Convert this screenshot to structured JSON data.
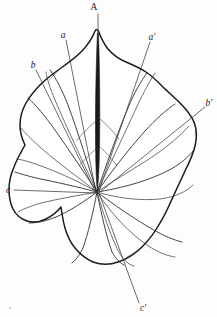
{
  "figure": {
    "background_color": "#fdfdfd",
    "outline_color": "#1a1a1a",
    "vein_color": "#222222",
    "leader_color": "#3a3a3a",
    "label_color": "#1a1a1a"
  },
  "labels": {
    "apex": "A",
    "a": "a",
    "a_prime": "a'",
    "b": "b",
    "b_prime": "b'",
    "c": "c",
    "c_prime": "c'"
  }
}
